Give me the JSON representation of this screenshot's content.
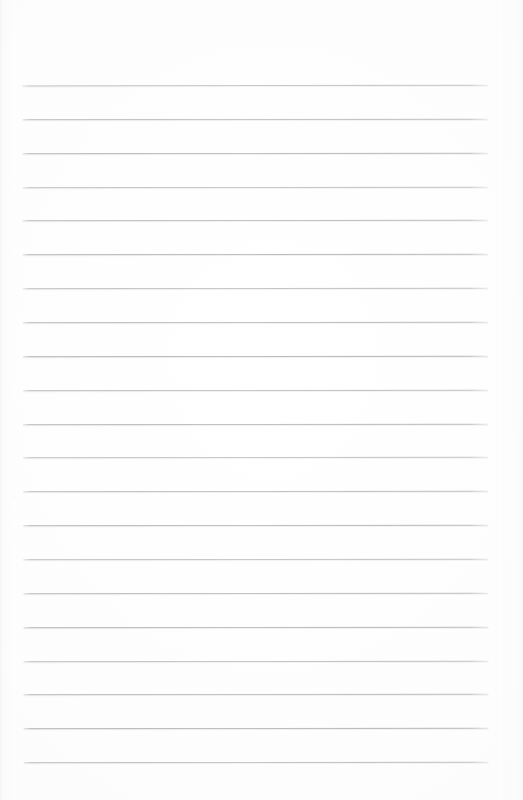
{
  "document": {
    "type": "scanned-lined-paper",
    "title": "Blank ruled notebook page",
    "page_width": 523,
    "page_height": 800,
    "background_color": "#fdfdfd",
    "has_text_content": false,
    "has_handwriting": false,
    "has_margin_rule": false,
    "orientation": "portrait"
  },
  "rules": {
    "label": "horizontal ruled lines",
    "count": 21,
    "color": "#b2b2b2",
    "thickness_px": 1,
    "left_x": 23,
    "right_x": 488,
    "line_width_px": 465,
    "first_line_y": 85,
    "last_line_y": 762,
    "spacing_px": 33.85,
    "skew_degrees": -0.09,
    "line_y_positions": [
      85,
      118.9,
      152.7,
      186.6,
      220.4,
      254.3,
      288.1,
      322,
      355.8,
      389.7,
      423.5,
      457.4,
      491.2,
      525.1,
      558.9,
      592.8,
      626.6,
      660.5,
      694.3,
      728.2,
      762
    ]
  },
  "margins": {
    "top_blank_px": 85,
    "bottom_blank_px": 38,
    "left_px": 23,
    "right_px": 35
  },
  "artifacts": {
    "left_edge_banding": true,
    "speckle_dust": true,
    "paper_tone": "off-white"
  }
}
